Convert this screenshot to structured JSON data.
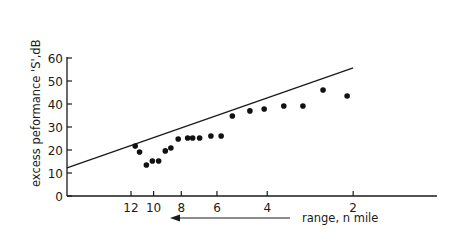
{
  "chart_data": {
    "type": "scatter",
    "title": "",
    "xlabel": "range, n mile",
    "ylabel": "excess peformance 'S',dB",
    "x_scale": "log",
    "x_direction": "decreasing (range decreases to the right; arrow points left)",
    "x_ticks": [
      12,
      10,
      8,
      6,
      4,
      2
    ],
    "y_ticks": [
      0,
      10,
      20,
      30,
      40,
      50,
      60
    ],
    "ylim": [
      0,
      60
    ],
    "grid": false,
    "legend": null,
    "series": [
      {
        "name": "measured",
        "kind": "points",
        "x": [
          11.6,
          11.2,
          10.6,
          10.1,
          9.6,
          9.1,
          8.7,
          8.2,
          7.6,
          7.3,
          6.9,
          6.3,
          5.8,
          5.3,
          4.6,
          4.1,
          3.5,
          3.0,
          2.55,
          2.1
        ],
        "y": [
          21.7,
          19.1,
          13.5,
          15.2,
          15.2,
          19.6,
          20.9,
          24.8,
          25.2,
          25.2,
          25.2,
          26.1,
          26.1,
          34.8,
          37.0,
          37.8,
          39.1,
          39.1,
          46.1,
          43.5
        ]
      },
      {
        "name": "predicted",
        "kind": "line",
        "x": [
          20.0,
          2.0
        ],
        "y": [
          12.2,
          55.7
        ]
      }
    ],
    "annotations": [
      {
        "type": "arrow",
        "direction": "left",
        "label": "range, n mile"
      }
    ]
  },
  "labels": {
    "ylabel": "excess peformance 'S',dB",
    "xlabel": "range, n mile"
  }
}
